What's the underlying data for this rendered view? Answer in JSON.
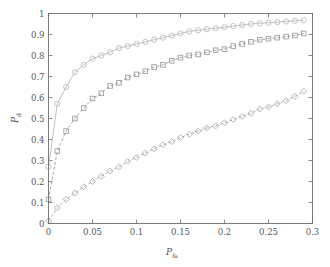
{
  "chart_data": {
    "type": "line",
    "title": "",
    "subtitle": "",
    "xlabel": "P_fa",
    "xlabel_base": "P",
    "xlabel_sub": "fa",
    "ylabel": "P_d",
    "ylabel_base": "P",
    "ylabel_sub": "d",
    "xlim": [
      0,
      0.3
    ],
    "ylim": [
      0,
      1
    ],
    "grid": false,
    "legend": "none",
    "xticks": [
      0,
      0.05,
      0.1,
      0.15,
      0.2,
      0.25,
      0.3
    ],
    "xtick_labels": [
      "0",
      "0.05",
      "0.1",
      "0.15",
      "0.2",
      "0.25",
      "0.3"
    ],
    "yticks": [
      0,
      0.1,
      0.2,
      0.3,
      0.4,
      0.5,
      0.6,
      0.7,
      0.8,
      0.9,
      1
    ],
    "ytick_labels": [
      "0",
      "0.1",
      "0.2",
      "0.3",
      "0.4",
      "0.5",
      "0.6",
      "0.7",
      "0.8",
      "0.9",
      "1"
    ],
    "x": [
      0,
      0.01,
      0.02,
      0.03,
      0.04,
      0.05,
      0.06,
      0.07,
      0.08,
      0.09,
      0.1,
      0.11,
      0.12,
      0.13,
      0.14,
      0.15,
      0.16,
      0.17,
      0.18,
      0.19,
      0.2,
      0.21,
      0.22,
      0.23,
      0.24,
      0.25,
      0.26,
      0.27,
      0.28,
      0.29
    ],
    "series": [
      {
        "name": "curve-circles",
        "marker": "circle",
        "linestyle": "solid",
        "color": "#b9b9b9",
        "values": [
          0.27,
          0.57,
          0.65,
          0.72,
          0.755,
          0.785,
          0.8,
          0.815,
          0.835,
          0.845,
          0.855,
          0.865,
          0.875,
          0.885,
          0.895,
          0.905,
          0.915,
          0.92,
          0.925,
          0.93,
          0.935,
          0.94,
          0.945,
          0.95,
          0.953,
          0.956,
          0.959,
          0.962,
          0.965,
          0.968
        ]
      },
      {
        "name": "curve-squares",
        "marker": "square",
        "linestyle": "dashed",
        "color": "#9a9a9a",
        "values": [
          0.115,
          0.345,
          0.44,
          0.5,
          0.55,
          0.595,
          0.62,
          0.655,
          0.67,
          0.695,
          0.71,
          0.725,
          0.745,
          0.755,
          0.775,
          0.79,
          0.8,
          0.805,
          0.815,
          0.825,
          0.83,
          0.845,
          0.855,
          0.865,
          0.875,
          0.88,
          0.885,
          0.89,
          0.895,
          0.905
        ]
      },
      {
        "name": "curve-diamonds",
        "marker": "diamond",
        "linestyle": "dashed",
        "color": "#a8a8a8",
        "values": [
          0.012,
          0.075,
          0.115,
          0.145,
          0.175,
          0.2,
          0.225,
          0.25,
          0.27,
          0.295,
          0.315,
          0.335,
          0.355,
          0.375,
          0.39,
          0.41,
          0.425,
          0.44,
          0.455,
          0.465,
          0.48,
          0.495,
          0.51,
          0.525,
          0.545,
          0.555,
          0.57,
          0.585,
          0.605,
          0.63
        ]
      }
    ]
  },
  "figure": {
    "background": "#ffffff",
    "axis_color": "#6f6f6f",
    "text_color": "#555555"
  }
}
